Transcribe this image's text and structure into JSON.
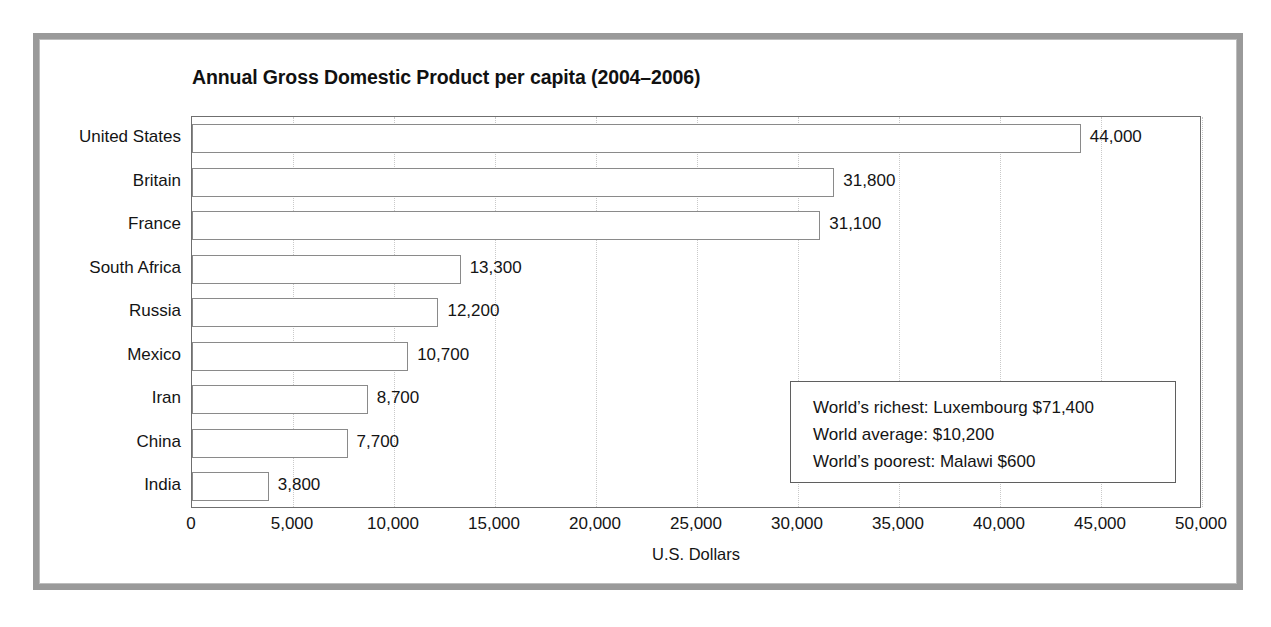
{
  "chart_data": {
    "type": "bar",
    "orientation": "horizontal",
    "title": "Annual Gross Domestic Product per capita (2004–2006)",
    "xlabel": "U.S. Dollars",
    "ylabel": "",
    "xlim": [
      0,
      50000
    ],
    "grid": true,
    "legend": "none",
    "categories": [
      "United States",
      "Britain",
      "France",
      "South Africa",
      "Russia",
      "Mexico",
      "Iran",
      "China",
      "India"
    ],
    "values": [
      44000,
      31800,
      31100,
      13300,
      12200,
      10700,
      8700,
      7700,
      3800
    ],
    "value_labels": [
      "44,000",
      "31,800",
      "31,100",
      "13,300",
      "12,200",
      "10,700",
      "8,700",
      "7,700",
      "3,800"
    ],
    "xticks": [
      0,
      5000,
      10000,
      15000,
      20000,
      25000,
      30000,
      35000,
      40000,
      45000,
      50000
    ],
    "xtick_labels": [
      "0",
      "5,000",
      "10,000",
      "15,000",
      "20,000",
      "25,000",
      "30,000",
      "35,000",
      "40,000",
      "45,000",
      "50,000"
    ],
    "annotations": [
      "World’s richest: Luxembourg $71,400",
      "World average: $10,200",
      "World’s poorest: Malawi $600"
    ],
    "colors": {
      "bar_fill": "#ffffff",
      "bar_outline": "#8a8a8a",
      "plot_border": "#6f6f6f",
      "gridline": "#c9c9c9",
      "frame": "#9a9a9a",
      "text": "#141414"
    }
  }
}
